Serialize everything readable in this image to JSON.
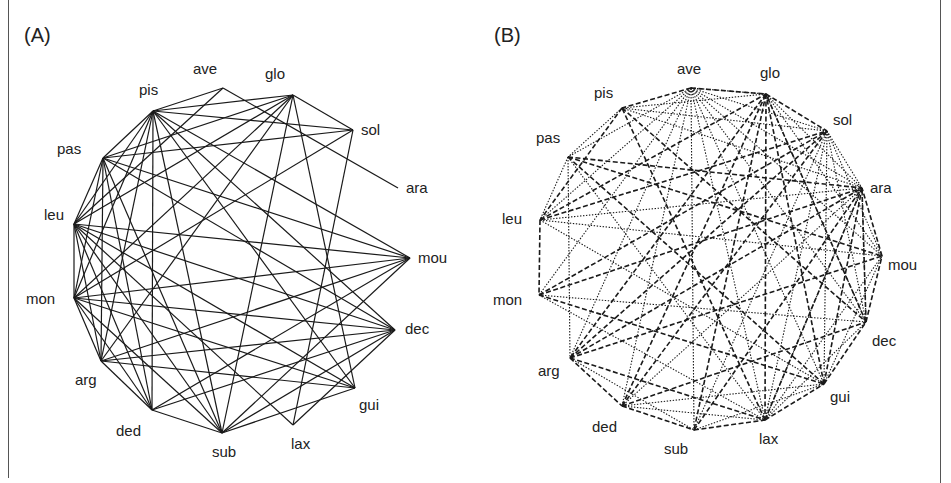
{
  "panels": [
    {
      "id": "A",
      "label": "(A)",
      "edge_style": "solid",
      "nodes": [
        "ave",
        "glo",
        "sol",
        "ara",
        "pis",
        "pas",
        "leu",
        "mou",
        "mon",
        "dec",
        "arg",
        "gui",
        "ded",
        "sub",
        "lax"
      ],
      "edges": [
        [
          "ave",
          "pis"
        ],
        [
          "ave",
          "ara"
        ],
        [
          "ave",
          "leu"
        ],
        [
          "glo",
          "pis"
        ],
        [
          "glo",
          "pas"
        ],
        [
          "glo",
          "leu"
        ],
        [
          "glo",
          "mon"
        ],
        [
          "glo",
          "sol"
        ],
        [
          "glo",
          "sub"
        ],
        [
          "glo",
          "gui"
        ],
        [
          "glo",
          "arg"
        ],
        [
          "sol",
          "pis"
        ],
        [
          "sol",
          "pas"
        ],
        [
          "sol",
          "mon"
        ],
        [
          "sol",
          "lax"
        ],
        [
          "pis",
          "pas"
        ],
        [
          "pis",
          "leu"
        ],
        [
          "pis",
          "mon"
        ],
        [
          "pis",
          "arg"
        ],
        [
          "pis",
          "ded"
        ],
        [
          "pis",
          "sub"
        ],
        [
          "pis",
          "mou"
        ],
        [
          "pis",
          "dec"
        ],
        [
          "pis",
          "gui"
        ],
        [
          "pas",
          "leu"
        ],
        [
          "pas",
          "mon"
        ],
        [
          "pas",
          "arg"
        ],
        [
          "pas",
          "ded"
        ],
        [
          "pas",
          "sub"
        ],
        [
          "pas",
          "mou"
        ],
        [
          "pas",
          "dec"
        ],
        [
          "leu",
          "mon"
        ],
        [
          "leu",
          "arg"
        ],
        [
          "leu",
          "ded"
        ],
        [
          "leu",
          "sub"
        ],
        [
          "leu",
          "mou"
        ],
        [
          "leu",
          "dec"
        ],
        [
          "leu",
          "gui"
        ],
        [
          "leu",
          "lax"
        ],
        [
          "mon",
          "arg"
        ],
        [
          "mon",
          "ded"
        ],
        [
          "mon",
          "sub"
        ],
        [
          "mon",
          "mou"
        ],
        [
          "mon",
          "dec"
        ],
        [
          "mon",
          "gui"
        ],
        [
          "arg",
          "ded"
        ],
        [
          "arg",
          "dec"
        ],
        [
          "arg",
          "gui"
        ],
        [
          "arg",
          "mou"
        ],
        [
          "ded",
          "sub"
        ],
        [
          "ded",
          "dec"
        ],
        [
          "ded",
          "mou"
        ],
        [
          "sub",
          "dec"
        ],
        [
          "sub",
          "mou"
        ],
        [
          "sub",
          "gui"
        ],
        [
          "lax",
          "dec"
        ]
      ]
    },
    {
      "id": "B",
      "label": "(B)",
      "edge_style": "dashed-and-dotted",
      "nodes": [
        "ave",
        "glo",
        "sol",
        "ara",
        "pis",
        "pas",
        "leu",
        "mou",
        "mon",
        "dec",
        "arg",
        "gui",
        "ded",
        "sub",
        "lax"
      ],
      "edges_dashed": [
        [
          "ave",
          "pis"
        ],
        [
          "ave",
          "glo"
        ],
        [
          "glo",
          "sol"
        ],
        [
          "glo",
          "sub"
        ],
        [
          "glo",
          "arg"
        ],
        [
          "glo",
          "lax"
        ],
        [
          "pis",
          "dec"
        ],
        [
          "pis",
          "leu"
        ],
        [
          "pas",
          "ara"
        ],
        [
          "pas",
          "mou"
        ],
        [
          "leu",
          "sol"
        ],
        [
          "leu",
          "mon"
        ],
        [
          "leu",
          "glo"
        ],
        [
          "mon",
          "sol"
        ],
        [
          "mon",
          "gui"
        ],
        [
          "mon",
          "ara"
        ],
        [
          "arg",
          "sol"
        ],
        [
          "arg",
          "ara"
        ],
        [
          "arg",
          "ded"
        ],
        [
          "arg",
          "lax"
        ],
        [
          "arg",
          "mou"
        ],
        [
          "ded",
          "sub"
        ],
        [
          "ded",
          "sol"
        ],
        [
          "ded",
          "glo"
        ],
        [
          "ded",
          "dec"
        ],
        [
          "sub",
          "lax"
        ],
        [
          "sub",
          "ara"
        ],
        [
          "lax",
          "gui"
        ],
        [
          "lax",
          "pis"
        ],
        [
          "lax",
          "ara"
        ],
        [
          "gui",
          "glo"
        ],
        [
          "gui",
          "pas"
        ],
        [
          "gui",
          "ara"
        ],
        [
          "gui",
          "dec"
        ],
        [
          "dec",
          "mou"
        ],
        [
          "dec",
          "ara"
        ],
        [
          "dec",
          "glo"
        ],
        [
          "mou",
          "ara"
        ]
      ],
      "edges_dotted": [
        [
          "ave",
          "glo"
        ],
        [
          "ave",
          "sol"
        ],
        [
          "ave",
          "ara"
        ],
        [
          "ave",
          "pas"
        ],
        [
          "ave",
          "leu"
        ],
        [
          "ave",
          "mon"
        ],
        [
          "ave",
          "arg"
        ],
        [
          "ave",
          "ded"
        ],
        [
          "ave",
          "sub"
        ],
        [
          "ave",
          "lax"
        ],
        [
          "ave",
          "gui"
        ],
        [
          "ave",
          "dec"
        ],
        [
          "ave",
          "mou"
        ],
        [
          "glo",
          "pis"
        ],
        [
          "glo",
          "ara"
        ],
        [
          "glo",
          "mou"
        ],
        [
          "glo",
          "dec"
        ],
        [
          "sol",
          "pis"
        ],
        [
          "sol",
          "ara"
        ],
        [
          "sol",
          "mou"
        ],
        [
          "sol",
          "dec"
        ],
        [
          "sol",
          "gui"
        ],
        [
          "sol",
          "lax"
        ],
        [
          "sol",
          "sub"
        ],
        [
          "ara",
          "pis"
        ],
        [
          "ara",
          "leu"
        ],
        [
          "ara",
          "ded"
        ],
        [
          "ara",
          "lax"
        ],
        [
          "ara",
          "dec"
        ],
        [
          "pis",
          "pas"
        ],
        [
          "pas",
          "leu"
        ],
        [
          "pas",
          "arg"
        ],
        [
          "pas",
          "lax"
        ],
        [
          "leu",
          "mou"
        ],
        [
          "leu",
          "gui"
        ],
        [
          "mon",
          "dec"
        ],
        [
          "mon",
          "lax"
        ],
        [
          "arg",
          "sub"
        ],
        [
          "ded",
          "lax"
        ],
        [
          "ded",
          "gui"
        ],
        [
          "sub",
          "gui"
        ],
        [
          "lax",
          "mou"
        ],
        [
          "lax",
          "dec"
        ],
        [
          "gui",
          "mou"
        ]
      ]
    }
  ]
}
